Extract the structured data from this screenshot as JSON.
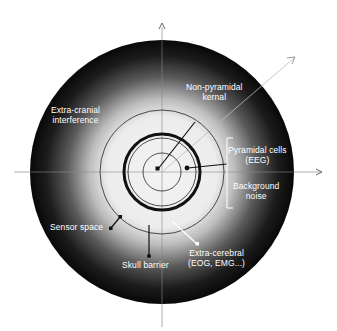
{
  "diagram": {
    "title": "",
    "labels": {
      "non_pyramidal": [
        "Non-pyramidal",
        "kernal"
      ],
      "extra_cranial": [
        "Extra-cranial",
        "interference"
      ],
      "pyramidal": [
        "Pyramidal cells",
        "(EEG)"
      ],
      "background": [
        "Background",
        "noise"
      ],
      "sensor_space": "Sensor space",
      "skull_barrier": "Skull barrier",
      "extra_cerebral": [
        "Extra-cerebral",
        "(EOG, EMG...)"
      ]
    },
    "colors": {
      "background": "#ffffff",
      "disk_outer": "#0a0a0a",
      "disk_inner": "#f2f2f2",
      "ring": "#111111",
      "label_text": "#ffffff",
      "axis": "#9a9a9a"
    },
    "geometry": {
      "center": [
        162,
        172
      ],
      "outer_radius": 132,
      "sensor_ring_radius": 62,
      "skull_ring_radius": 38,
      "inner_ring_radius": 35,
      "kernel_radius": 19
    }
  }
}
